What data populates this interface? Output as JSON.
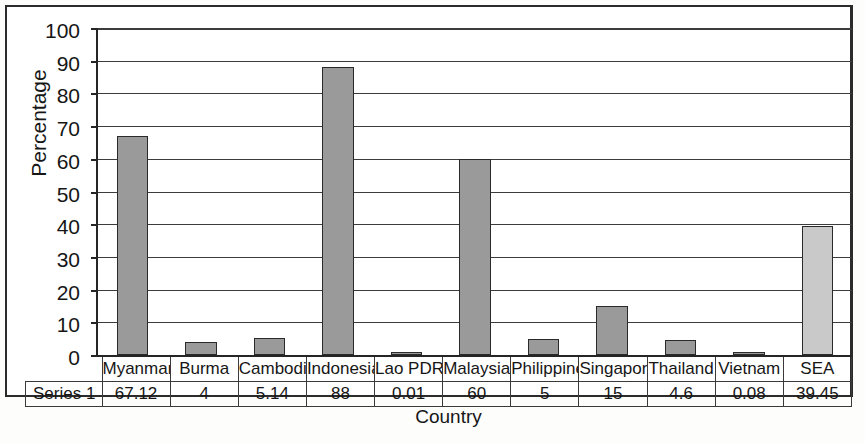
{
  "chart_data": {
    "type": "bar",
    "title": "",
    "xlabel": "Country",
    "ylabel": "Percentage",
    "ylim": [
      0,
      100
    ],
    "ytick_step": 10,
    "yticks": [
      100,
      90,
      80,
      70,
      60,
      50,
      40,
      30,
      20,
      10,
      0
    ],
    "grid": true,
    "legend": false,
    "series_name": "Series 1",
    "categories": [
      "Myanmar",
      "Burma",
      "Cambodia",
      "Indonesia",
      "Lao PDR",
      "Malaysia",
      "Philippines",
      "Singapore",
      "Thailand",
      "Vietnam",
      "SEA"
    ],
    "values": [
      67.12,
      4,
      5.14,
      88,
      0.01,
      60,
      5,
      15,
      4.6,
      0.08,
      39.45
    ],
    "value_labels": [
      "67.12",
      "4",
      "5.14",
      "88",
      "0.01",
      "60",
      "5",
      "15",
      "4.6",
      "0.08",
      "39.45"
    ],
    "bar_colors": [
      "#9a9a9a",
      "#9a9a9a",
      "#9a9a9a",
      "#9a9a9a",
      "#9a9a9a",
      "#9a9a9a",
      "#9a9a9a",
      "#9a9a9a",
      "#9a9a9a",
      "#9a9a9a",
      "#c9c9c9"
    ],
    "bar_outline_color": "#2a2a2a"
  },
  "data_table": {
    "row_label": "Series 1",
    "headers": [
      "Myanmar",
      "Burma",
      "Cambodia",
      "Indonesia",
      "Lao PDR",
      "Malaysia",
      "Philippines",
      "Singapore",
      "Thailand",
      "Vietnam",
      "SEA"
    ],
    "values": [
      "67.12",
      "4",
      "5.14",
      "88",
      "0.01",
      "60",
      "5",
      "15",
      "4.6",
      "0.08",
      "39.45"
    ]
  },
  "axes": {
    "y_title": "Percentage",
    "x_title": "Country"
  }
}
